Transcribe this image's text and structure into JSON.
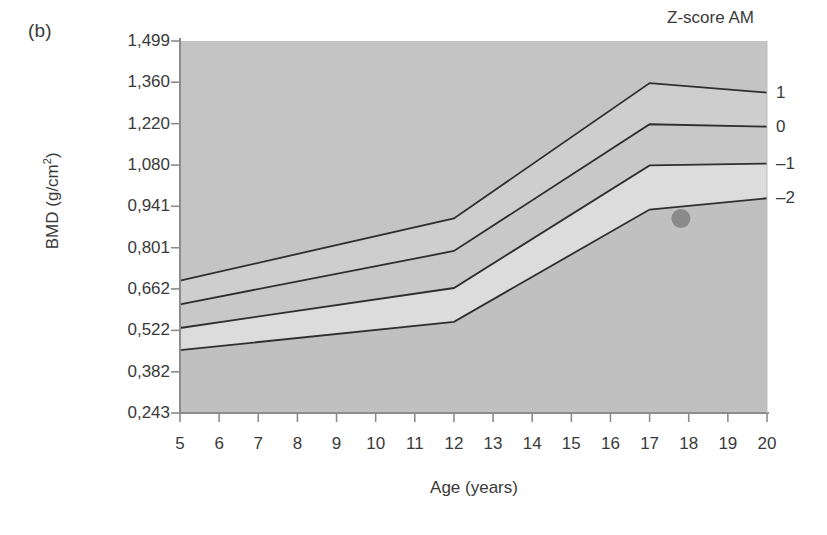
{
  "panel": {
    "label": "(b)"
  },
  "legend": {
    "title": "Z-score AM"
  },
  "axes": {
    "ylabel_text": "BMD (g/cm",
    "ylabel_sup": "2",
    "ylabel_tail": ")",
    "xlabel": "Age (years)"
  },
  "chart_data": {
    "type": "line",
    "title": "",
    "subtitle": "",
    "xlabel": "Age (years)",
    "ylabel": "BMD (g/cm2)",
    "xlim": [
      5,
      20
    ],
    "ylim": [
      0.243,
      1.499
    ],
    "grid": false,
    "legend_position": "right-outside",
    "legend_title": "Z-score AM",
    "decimal_separator": ",",
    "xticks": [
      5,
      6,
      7,
      8,
      9,
      10,
      11,
      12,
      13,
      14,
      15,
      16,
      17,
      18,
      19,
      20
    ],
    "xtick_labels": [
      "5",
      "6",
      "7",
      "8",
      "9",
      "10",
      "11",
      "12",
      "13",
      "14",
      "15",
      "16",
      "17",
      "18",
      "19",
      "20"
    ],
    "yticks": [
      0.243,
      0.382,
      0.522,
      0.662,
      0.801,
      0.941,
      1.08,
      1.22,
      1.36,
      1.499
    ],
    "ytick_labels": [
      "0,243",
      "0,382",
      "0,522",
      "0,662",
      "0,801",
      "0,941",
      "1,080",
      "1,220",
      "1,360",
      "1,499"
    ],
    "x": [
      5,
      12,
      17,
      20
    ],
    "series": [
      {
        "name": "1",
        "label": "1",
        "values": [
          0.69,
          0.9,
          1.357,
          1.325
        ]
      },
      {
        "name": "0",
        "label": "0",
        "values": [
          0.61,
          0.79,
          1.218,
          1.21
        ]
      },
      {
        "name": "-1",
        "label": "–1",
        "values": [
          0.53,
          0.665,
          1.079,
          1.085
        ]
      },
      {
        "name": "-2",
        "label": "–2",
        "values": [
          0.455,
          0.551,
          0.93,
          0.968
        ]
      }
    ],
    "bands": [
      {
        "name": "above-1",
        "color": "#c4c4c4"
      },
      {
        "name": "1-to-0",
        "color": "#cecece"
      },
      {
        "name": "0-to-m1",
        "color": "#c8c8c8"
      },
      {
        "name": "m1-to-m2",
        "color": "#dcdcdc"
      },
      {
        "name": "below-m2",
        "color": "#c0c0c0"
      }
    ],
    "points": [
      {
        "name": "patient-measurement",
        "x": 17.8,
        "y": 0.9,
        "color": "#8a8a8a"
      }
    ],
    "line_color": "#2f2f2f",
    "plot_background": "#c8c8c8"
  }
}
